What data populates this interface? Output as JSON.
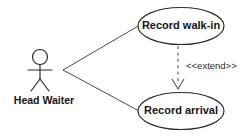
{
  "diagram": {
    "type": "uml-use-case-diagram",
    "background_color": "#ffffff",
    "stroke_color": "#2b2b2b",
    "text_color": "#141414",
    "actor": {
      "name": "head-waiter",
      "label": "Head Waiter",
      "icon": "stick-figure-actor-icon"
    },
    "use_cases": [
      {
        "id": "record-walk-in",
        "label": "Record walk-in"
      },
      {
        "id": "record-arrival",
        "label": "Record arrival"
      }
    ],
    "associations": [
      {
        "id": "assoc-head-waiter-record-walk-in",
        "from": "Head Waiter",
        "to": "Record walk-in"
      },
      {
        "id": "assoc-head-waiter-record-arrival",
        "from": "Head Waiter",
        "to": "Record arrival"
      }
    ],
    "dependencies": [
      {
        "id": "extend-walk-in-to-arrival",
        "stereotype": "<<extend>>",
        "from": "Record walk-in",
        "to": "Record arrival",
        "line_style": "dashed",
        "arrow": "open"
      }
    ]
  }
}
